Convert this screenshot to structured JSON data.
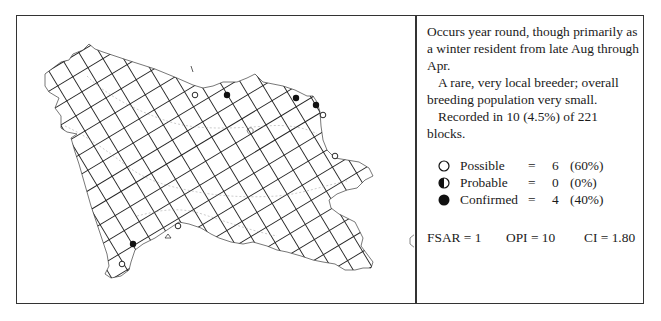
{
  "map": {
    "grid_rotation_deg": -31,
    "grid_cell_px": 17.6,
    "line_color": "#222222",
    "outline_color": "#555555",
    "markers": [
      {
        "type": "possible",
        "x": 178,
        "y": 79
      },
      {
        "type": "confirmed",
        "x": 210,
        "y": 79
      },
      {
        "type": "confirmed",
        "x": 279,
        "y": 82
      },
      {
        "type": "confirmed",
        "x": 299,
        "y": 89
      },
      {
        "type": "possible",
        "x": 306,
        "y": 99
      },
      {
        "type": "possible",
        "x": 318,
        "y": 140
      },
      {
        "type": "possible",
        "x": 161,
        "y": 210
      },
      {
        "type": "confirmed",
        "x": 116,
        "y": 228
      },
      {
        "type": "possible",
        "x": 105,
        "y": 248
      }
    ]
  },
  "description": {
    "para1": "Occurs year round, though primarily as a winter resident from late Aug through Apr.",
    "para2": "A rare, very local breeder; overall breeding population very small.",
    "para3": "Recorded in 10 (4.5%) of 221 blocks."
  },
  "legend": [
    {
      "symbol": "open-circle-icon",
      "label": "Possible",
      "eq": "=",
      "count": "6",
      "pct": "(60%)"
    },
    {
      "symbol": "half-circle-icon",
      "label": "Probable",
      "eq": "=",
      "count": "0",
      "pct": "(0%)"
    },
    {
      "symbol": "filled-circle-icon",
      "label": "Confirmed",
      "eq": "=",
      "count": "4",
      "pct": "(40%)"
    }
  ],
  "indices": {
    "fsar": "FSAR = 1",
    "opi": "OPI = 10",
    "ci": "CI = 1.80"
  }
}
